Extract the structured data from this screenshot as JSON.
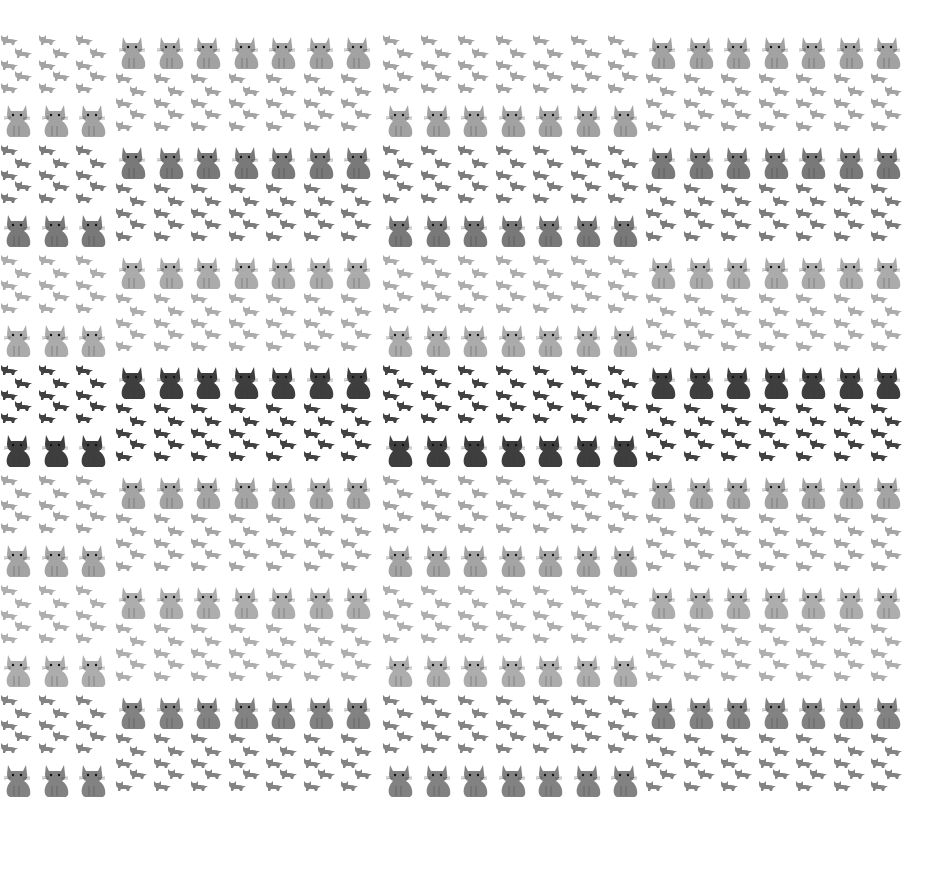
{
  "pattern": {
    "description": "Tiled wallpaper of sitting cats and small kittens",
    "bands": [
      {
        "tone": "light",
        "color": "#9a9a9a",
        "top": 32
      },
      {
        "tone": "medium",
        "color": "#6e6e6e",
        "top": 142
      },
      {
        "tone": "light",
        "color": "#a4a4a4",
        "top": 252
      },
      {
        "tone": "dark",
        "color": "#2e2e2e",
        "top": 362
      },
      {
        "tone": "light",
        "color": "#9c9c9c",
        "top": 472
      },
      {
        "tone": "light",
        "color": "#a6a6a6",
        "top": 582
      },
      {
        "tone": "medium",
        "color": "#777777",
        "top": 692
      }
    ],
    "blocks": [
      {
        "left": 0,
        "columns": 3,
        "layout": "kittens-top"
      },
      {
        "left": 115,
        "columns": 7,
        "layout": "cat-top"
      },
      {
        "left": 382,
        "columns": 7,
        "layout": "kittens-top"
      },
      {
        "left": 645,
        "columns": 7,
        "layout": "cat-top"
      }
    ]
  }
}
